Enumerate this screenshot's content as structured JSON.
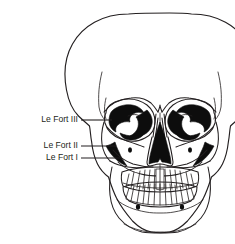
{
  "figure": {
    "background_color": "#ffffff",
    "ink_color": "#231f20",
    "cavity_color": "#0d0d0d",
    "width": 235,
    "height": 244
  },
  "labels": [
    {
      "id": "le-fort-3",
      "text": "Le Fort III",
      "text_x": 78,
      "text_y": 120,
      "leader_x1": 81,
      "leader_x2": 112,
      "leader_y": 120
    },
    {
      "id": "le-fort-2",
      "text": "Le Fort II",
      "text_x": 78,
      "text_y": 146,
      "leader_x1": 81,
      "leader_x2": 116,
      "leader_y": 146
    },
    {
      "id": "le-fort-1",
      "text": "Le Fort I",
      "text_x": 78,
      "text_y": 158,
      "leader_x1": 81,
      "leader_x2": 120,
      "leader_y": 158
    }
  ],
  "anatomy": {
    "parts": [
      "cranial-vault",
      "frontal-bone",
      "left-orbit",
      "right-orbit",
      "nasal-aperture",
      "left-zygomatic-arch",
      "right-zygomatic-arch",
      "maxilla",
      "upper-teeth",
      "lower-teeth",
      "mandible",
      "mental-foramen-left",
      "mental-foramen-right"
    ],
    "upper_tooth_count": 14,
    "lower_tooth_count": 14
  }
}
